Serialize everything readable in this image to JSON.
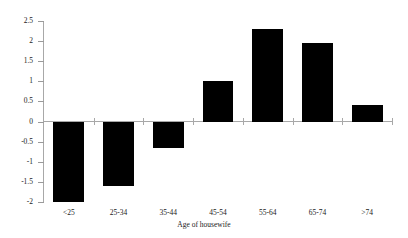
{
  "chart_data": {
    "type": "bar",
    "title": "",
    "subtitle": "",
    "xlabel": "Age of housewife",
    "ylabel": "",
    "categories": [
      "<25",
      "25-34",
      "35-44",
      "45-54",
      "55-64",
      "65-74",
      ">74"
    ],
    "values": [
      -2.0,
      -1.6,
      -0.65,
      1.0,
      2.3,
      1.95,
      0.4
    ],
    "series": [
      {
        "name": "",
        "values": [
          -2.0,
          -1.6,
          -0.65,
          1.0,
          2.3,
          1.95,
          0.4
        ]
      }
    ],
    "ylim": [
      -2,
      2.5
    ],
    "ytick_labels": [
      "2.5",
      "2",
      "1.5",
      "1",
      "0.5",
      "0",
      "-0.5",
      "-1",
      "-1.5",
      "-2"
    ],
    "ytick_values": [
      2.5,
      2,
      1.5,
      1,
      0.5,
      0,
      -0.5,
      -1,
      -1.5,
      -2
    ],
    "grid": false,
    "legend": null,
    "legend_position": "none",
    "bar_color": "#000000",
    "axis_color": "#a8a8a8",
    "background_color": "#ffffff",
    "annotations": []
  }
}
